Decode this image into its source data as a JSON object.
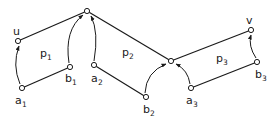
{
  "diagram": {
    "nodes": [
      {
        "id": "u",
        "label": "u",
        "sub": "",
        "x": 18,
        "y": 41
      },
      {
        "id": "a1",
        "label": "a",
        "sub": "1",
        "x": 22,
        "y": 88
      },
      {
        "id": "top",
        "label": "",
        "sub": "",
        "x": 87,
        "y": 11
      },
      {
        "id": "b1",
        "label": "b",
        "sub": "1",
        "x": 70,
        "y": 67
      },
      {
        "id": "a2",
        "label": "a",
        "sub": "2",
        "x": 94,
        "y": 65
      },
      {
        "id": "b2",
        "label": "b",
        "sub": "2",
        "x": 146,
        "y": 97
      },
      {
        "id": "mid",
        "label": "",
        "sub": "",
        "x": 171,
        "y": 61
      },
      {
        "id": "a3",
        "label": "a",
        "sub": "3",
        "x": 191,
        "y": 88
      },
      {
        "id": "v",
        "label": "v",
        "sub": "",
        "x": 251,
        "y": 30
      },
      {
        "id": "b3",
        "label": "b",
        "sub": "3",
        "x": 257,
        "y": 62
      }
    ],
    "edges": [
      [
        "u",
        "top"
      ],
      [
        "a1",
        "b1"
      ],
      [
        "top",
        "mid"
      ],
      [
        "a2",
        "b2"
      ],
      [
        "mid",
        "v"
      ],
      [
        "a3",
        "b3"
      ]
    ],
    "arcs": [
      {
        "from": "a1",
        "to": "u"
      },
      {
        "from": "b1",
        "to": "top"
      },
      {
        "from": "a2",
        "to": "top"
      },
      {
        "from": "b2",
        "to": "mid"
      },
      {
        "from": "a3",
        "to": "mid"
      },
      {
        "from": "b3",
        "to": "v"
      }
    ],
    "regions": [
      {
        "label": "p",
        "sub": "1",
        "x": 44,
        "y": 57
      },
      {
        "label": "p",
        "sub": "2",
        "x": 123,
        "y": 56
      },
      {
        "label": "p",
        "sub": "3",
        "x": 213,
        "y": 62
      }
    ],
    "labels": {
      "u": "u",
      "v": "v",
      "a1": "a",
      "a1_sub": "1",
      "b1": "b",
      "b1_sub": "1",
      "a2": "a",
      "a2_sub": "2",
      "b2": "b",
      "b2_sub": "2",
      "a3": "a",
      "a3_sub": "3",
      "b3": "b",
      "b3_sub": "3",
      "p1": "p",
      "p1_sub": "1",
      "p2": "p",
      "p2_sub": "2",
      "p3": "p",
      "p3_sub": "3"
    }
  }
}
